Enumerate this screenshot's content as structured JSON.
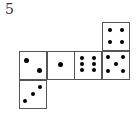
{
  "problem_number": "5",
  "net": {
    "cells": [
      {
        "id": "top",
        "value": 4,
        "left": 102,
        "top": 22,
        "dots": [
          [
            7,
            7
          ],
          [
            19,
            7
          ],
          [
            7,
            19
          ],
          [
            19,
            19
          ]
        ]
      },
      {
        "id": "middle-1",
        "value": 2,
        "left": 19,
        "top": 51,
        "dots": [
          [
            6,
            8
          ],
          [
            19,
            18
          ]
        ],
        "big": true
      },
      {
        "id": "middle-2",
        "value": 1,
        "left": 47,
        "top": 51,
        "dots": [
          [
            12,
            12
          ]
        ],
        "big": true
      },
      {
        "id": "middle-3",
        "value": 6,
        "left": 74,
        "top": 51,
        "dots": [
          [
            7,
            6
          ],
          [
            19,
            6
          ],
          [
            7,
            12
          ],
          [
            19,
            12
          ],
          [
            7,
            18
          ],
          [
            19,
            18
          ]
        ]
      },
      {
        "id": "middle-4",
        "value": 5,
        "left": 102,
        "top": 51,
        "dots": [
          [
            5,
            5
          ],
          [
            20,
            5
          ],
          [
            13,
            12
          ],
          [
            5,
            19
          ],
          [
            20,
            19
          ]
        ]
      },
      {
        "id": "bottom",
        "value": 3,
        "left": 19,
        "top": 80,
        "dots": [
          [
            20,
            6
          ],
          [
            13,
            13
          ],
          [
            5,
            20
          ]
        ]
      }
    ]
  },
  "colors": {
    "line": "#555555",
    "dot": "#000000",
    "background": "#ffffff"
  }
}
